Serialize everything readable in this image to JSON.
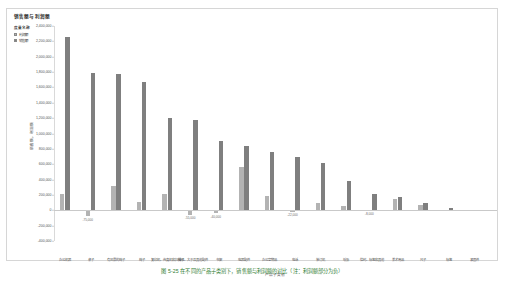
{
  "panel": {
    "title": "销售额与利润额"
  },
  "legend": {
    "title": "度量名称",
    "items": [
      {
        "label": "利润额",
        "color": "#b3b3b3",
        "key": "profit"
      },
      {
        "label": "销售额",
        "color": "#7f7f7f",
        "key": "sales"
      }
    ]
  },
  "axes": {
    "ylabel": "销售额，利润额",
    "xlabel": "产品子类别"
  },
  "caption": {
    "text": "图 5-25  在不同的产品子类别下，销售额与利润额的对比（注：利润额部分为负）"
  },
  "chart_data": {
    "type": "bar",
    "title": "销售额与利润额",
    "xlabel": "产品子类别",
    "ylabel": "销售额，利润额",
    "ylim": [
      -400000,
      2400000
    ],
    "ytick_labels": [
      "2,400,000",
      "2,200,000",
      "2,000,000",
      "1,800,000",
      "1,600,000",
      "1,400,000",
      "1,200,000",
      "1,000,000",
      "800,000",
      "600,000",
      "400,000",
      "200,000",
      "0",
      "-200,000",
      "-400,000"
    ],
    "ytick_values": [
      2400000,
      2200000,
      2000000,
      1800000,
      1600000,
      1400000,
      1200000,
      1000000,
      800000,
      600000,
      400000,
      200000,
      0,
      -200000,
      -400000
    ],
    "grid": false,
    "legend_position": "top-left",
    "categories": [
      "办公机器",
      "桌子",
      "有风景的椅子",
      "椅子",
      "复印机、传真机和扫描仪",
      "椅子、大于及其他配件",
      "书架",
      "电器配件",
      "办公室物品",
      "电话",
      "装订机",
      "纸张",
      "信封、标签和其他",
      "美术用品",
      "尺子",
      "标签",
      "紧固件"
    ],
    "series": [
      {
        "name": "利润额",
        "color": "#b3b3b3",
        "values": [
          215000,
          -75000,
          320000,
          110000,
          215000,
          -55000,
          -40000,
          560000,
          185000,
          -22000,
          95000,
          55000,
          -8000,
          145000,
          70000,
          10000,
          4000
        ]
      },
      {
        "name": "销售额",
        "color": "#7f7f7f",
        "values": [
          2255000,
          1790000,
          1775000,
          1670000,
          1200000,
          1180000,
          900000,
          840000,
          760000,
          700000,
          620000,
          380000,
          210000,
          175000,
          95000,
          28000,
          10000
        ]
      }
    ],
    "negative_value_labels": [
      "-75,000",
      "-55,000",
      "-40,000",
      "-22,000",
      "-8,000"
    ]
  }
}
